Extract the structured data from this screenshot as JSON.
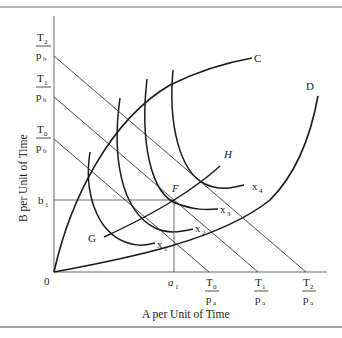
{
  "figure": {
    "x_axis_label": "A per Unit of Time",
    "y_axis_label": "B per Unit of Time",
    "origin_label": "0",
    "y_ticks": [
      {
        "num": "T",
        "sub": "2",
        "den": "p",
        "den_sub": "b"
      },
      {
        "num": "T",
        "sub": "1",
        "den": "p",
        "den_sub": "b"
      },
      {
        "num": "T",
        "sub": "0",
        "den": "p",
        "den_sub": "b"
      },
      {
        "num": "b",
        "sub": "1"
      }
    ],
    "x_ticks": [
      {
        "num": "a",
        "sub": "1"
      },
      {
        "num": "T",
        "sub": "0",
        "den": "p",
        "den_sub": "a"
      },
      {
        "num": "T",
        "sub": "1",
        "den": "p",
        "den_sub": "a"
      },
      {
        "num": "T",
        "sub": "2",
        "den": "p",
        "den_sub": "a"
      }
    ],
    "curve_labels": {
      "C": "C",
      "D": "D",
      "G": "G",
      "H": "H",
      "F": "F"
    },
    "isoquant_labels": [
      {
        "base": "x",
        "sub": "1"
      },
      {
        "base": "x",
        "sub": "2"
      },
      {
        "base": "x",
        "sub": "3"
      },
      {
        "base": "x",
        "sub": "4"
      }
    ],
    "colors": {
      "ink": "#1a1a1a",
      "thin_line": "#3a3a3a",
      "rule": "#555555"
    }
  }
}
